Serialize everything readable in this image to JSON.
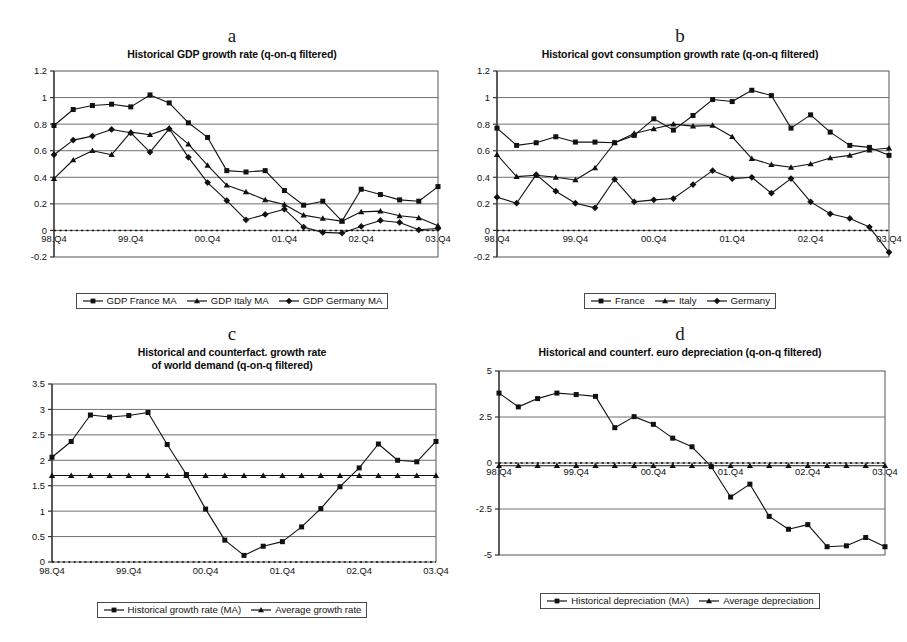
{
  "figure": {
    "panels": [
      "a",
      "b",
      "c",
      "d"
    ]
  },
  "panel_a": {
    "letter": "a",
    "title": "Historical GDP growth rate (q-on-q filtered)",
    "legend": [
      {
        "label": "GDP France MA",
        "marker": "square"
      },
      {
        "label": "GDP Italy MA",
        "marker": "triangle"
      },
      {
        "label": "GDP Germany MA",
        "marker": "diamond"
      }
    ]
  },
  "panel_b": {
    "letter": "b",
    "title": "Historical govt consumption growth rate (q-on-q filtered)",
    "legend": [
      {
        "label": "France",
        "marker": "square"
      },
      {
        "label": "Italy",
        "marker": "triangle"
      },
      {
        "label": "Germany",
        "marker": "diamond"
      }
    ]
  },
  "panel_c": {
    "letter": "c",
    "title_line1": "Historical and counterfact. growth rate",
    "title_line2": "of world demand (q-on-q filtered)",
    "legend": [
      {
        "label": "Historical growth rate (MA)",
        "marker": "square"
      },
      {
        "label": "Average growth rate",
        "marker": "triangle"
      }
    ]
  },
  "panel_d": {
    "letter": "d",
    "title": "Historical and counterf. euro depreciation (q-on-q filtered)",
    "legend": [
      {
        "label": "Historical depreciation (MA)",
        "marker": "square"
      },
      {
        "label": "Average depreciation",
        "marker": "triangle"
      }
    ]
  },
  "chart_data": [
    {
      "id": "a",
      "type": "line",
      "title": "Historical GDP growth rate (q-on-q filtered)",
      "xlabel": "",
      "ylabel": "",
      "ylim": [
        -0.2,
        1.2
      ],
      "yticks": [
        -0.2,
        0,
        0.2,
        0.4,
        0.6,
        0.8,
        1,
        1.2
      ],
      "ytick_labels": [
        "-0.2",
        "0",
        "0.2",
        "0.4",
        "0.6",
        "0.8",
        "1",
        "1.2"
      ],
      "grid": true,
      "zero_line": true,
      "legend_position": "below",
      "x": [
        "98.Q4",
        "99.Q1",
        "99.Q2",
        "99.Q3",
        "99.Q4",
        "00.Q1",
        "00.Q2",
        "00.Q3",
        "00.Q4",
        "01.Q1",
        "01.Q2",
        "01.Q3",
        "01.Q4",
        "02.Q1",
        "02.Q2",
        "02.Q3",
        "02.Q4",
        "03.Q1",
        "03.Q2",
        "03.Q3",
        "03.Q4"
      ],
      "xtick_labels": [
        "98.Q4",
        "99.Q4",
        "00.Q4",
        "01.Q4",
        "02.Q4",
        "03.Q4"
      ],
      "series": [
        {
          "name": "GDP France MA",
          "marker": "square",
          "values": [
            0.79,
            0.91,
            0.94,
            0.95,
            0.93,
            1.02,
            0.96,
            0.81,
            0.7,
            0.45,
            0.44,
            0.45,
            0.3,
            0.19,
            0.22,
            0.07,
            0.31,
            0.27,
            0.23,
            0.22,
            0.33
          ]
        },
        {
          "name": "GDP Italy MA",
          "marker": "triangle",
          "values": [
            0.39,
            0.53,
            0.6,
            0.57,
            0.74,
            0.72,
            0.77,
            0.65,
            0.49,
            0.34,
            0.29,
            0.23,
            0.195,
            0.115,
            0.09,
            0.07,
            0.14,
            0.145,
            0.11,
            0.095,
            0.035
          ]
        },
        {
          "name": "GDP Germany MA",
          "marker": "diamond",
          "values": [
            0.57,
            0.68,
            0.71,
            0.76,
            0.735,
            0.59,
            0.765,
            0.55,
            0.36,
            0.225,
            0.08,
            0.12,
            0.16,
            0.025,
            -0.015,
            -0.02,
            0.03,
            0.075,
            0.06,
            0.005,
            0.015
          ]
        }
      ]
    },
    {
      "id": "b",
      "type": "line",
      "title": "Historical govt consumption growth rate (q-on-q filtered)",
      "xlabel": "",
      "ylabel": "",
      "ylim": [
        -0.2,
        1.2
      ],
      "yticks": [
        -0.2,
        0,
        0.2,
        0.4,
        0.6,
        0.8,
        1,
        1.2
      ],
      "ytick_labels": [
        "-0.2",
        "0",
        "0.2",
        "0.4",
        "0.6",
        "0.8",
        "1",
        "1.2"
      ],
      "grid": true,
      "zero_line": true,
      "legend_position": "below",
      "x": [
        "98.Q4",
        "99.Q1",
        "99.Q2",
        "99.Q3",
        "99.Q4",
        "00.Q1",
        "00.Q2",
        "00.Q3",
        "00.Q4",
        "01.Q1",
        "01.Q2",
        "01.Q3",
        "01.Q4",
        "02.Q1",
        "02.Q2",
        "02.Q3",
        "02.Q4",
        "03.Q1",
        "03.Q2",
        "03.Q3",
        "03.Q4"
      ],
      "xtick_labels": [
        "98.Q4",
        "99.Q4",
        "00.Q4",
        "01.Q4",
        "02.Q4",
        "03.Q4"
      ],
      "series": [
        {
          "name": "France",
          "marker": "square",
          "values": [
            0.77,
            0.64,
            0.66,
            0.705,
            0.665,
            0.665,
            0.66,
            0.715,
            0.84,
            0.755,
            0.865,
            0.985,
            0.97,
            1.055,
            1.015,
            0.77,
            0.87,
            0.74,
            0.64,
            0.625,
            0.565
          ]
        },
        {
          "name": "Italy",
          "marker": "triangle",
          "values": [
            0.57,
            0.405,
            0.415,
            0.4,
            0.38,
            0.47,
            0.66,
            0.73,
            0.765,
            0.8,
            0.785,
            0.79,
            0.705,
            0.54,
            0.495,
            0.475,
            0.5,
            0.545,
            0.565,
            0.605,
            0.62
          ]
        },
        {
          "name": "Germany",
          "marker": "diamond",
          "values": [
            0.25,
            0.205,
            0.42,
            0.295,
            0.205,
            0.17,
            0.385,
            0.215,
            0.23,
            0.24,
            0.345,
            0.45,
            0.39,
            0.4,
            0.28,
            0.39,
            0.215,
            0.125,
            0.09,
            0.025,
            -0.165
          ]
        }
      ]
    },
    {
      "id": "c",
      "type": "line",
      "title": "Historical and counterfact. growth rate of world demand (q-on-q filtered)",
      "xlabel": "",
      "ylabel": "",
      "ylim": [
        0,
        3.5
      ],
      "yticks": [
        0,
        0.5,
        1,
        1.5,
        2,
        2.5,
        3,
        3.5
      ],
      "ytick_labels": [
        "0",
        "0.5",
        "1",
        "1.5",
        "2",
        "2.5",
        "3",
        "3.5"
      ],
      "grid": true,
      "zero_line": true,
      "legend_position": "below",
      "x": [
        "98.Q4",
        "99.Q1",
        "99.Q2",
        "99.Q3",
        "99.Q4",
        "00.Q1",
        "00.Q2",
        "00.Q3",
        "00.Q4",
        "01.Q1",
        "01.Q2",
        "01.Q3",
        "01.Q4",
        "02.Q1",
        "02.Q2",
        "02.Q3",
        "02.Q4",
        "03.Q1",
        "03.Q2",
        "03.Q3",
        "03.Q4"
      ],
      "xtick_labels": [
        "98.Q4",
        "99.Q4",
        "00.Q4",
        "01.Q4",
        "02.Q4",
        "03.Q4"
      ],
      "series": [
        {
          "name": "Historical growth rate (MA)",
          "marker": "square",
          "values": [
            2.06,
            2.37,
            2.89,
            2.85,
            2.88,
            2.94,
            2.31,
            1.72,
            1.04,
            0.43,
            0.13,
            0.31,
            0.4,
            0.69,
            1.05,
            1.48,
            1.85,
            2.32,
            2.0,
            1.97,
            2.37
          ]
        },
        {
          "name": "Average growth rate",
          "marker": "triangle",
          "values": [
            1.7,
            1.7,
            1.7,
            1.7,
            1.7,
            1.7,
            1.7,
            1.7,
            1.7,
            1.7,
            1.7,
            1.7,
            1.7,
            1.7,
            1.7,
            1.7,
            1.7,
            1.7,
            1.7,
            1.7,
            1.7
          ]
        }
      ]
    },
    {
      "id": "d",
      "type": "line",
      "title": "Historical and counterf. euro depreciation (q-on-q filtered)",
      "xlabel": "",
      "ylabel": "",
      "ylim": [
        -5,
        5
      ],
      "yticks": [
        -5,
        -2.5,
        0,
        2.5,
        5
      ],
      "ytick_labels": [
        "-5",
        "-2.5",
        "0",
        "2.5",
        "5"
      ],
      "grid": true,
      "zero_line": true,
      "legend_position": "below",
      "x": [
        "98.Q4",
        "99.Q1",
        "99.Q2",
        "99.Q3",
        "99.Q4",
        "00.Q1",
        "00.Q2",
        "00.Q3",
        "00.Q4",
        "01.Q1",
        "01.Q2",
        "01.Q3",
        "01.Q4",
        "02.Q1",
        "02.Q2",
        "02.Q3",
        "02.Q4",
        "03.Q1",
        "03.Q2",
        "03.Q3",
        "03.Q4"
      ],
      "xtick_labels": [
        "98.Q4",
        "99.Q4",
        "00.Q4",
        "01.Q4",
        "02.Q4",
        "03.Q4"
      ],
      "series": [
        {
          "name": "Historical depreciation (MA)",
          "marker": "square",
          "values": [
            3.8,
            3.05,
            3.5,
            3.8,
            3.72,
            3.62,
            1.92,
            2.52,
            2.1,
            1.35,
            0.88,
            -0.2,
            -1.85,
            -1.15,
            -2.9,
            -3.6,
            -3.35,
            -4.55,
            -4.5,
            -4.05,
            -4.55
          ]
        },
        {
          "name": "Average depreciation",
          "marker": "triangle",
          "values": [
            -0.15,
            -0.15,
            -0.15,
            -0.15,
            -0.15,
            -0.15,
            -0.15,
            -0.15,
            -0.15,
            -0.15,
            -0.15,
            -0.15,
            -0.15,
            -0.15,
            -0.15,
            -0.15,
            -0.15,
            -0.15,
            -0.15,
            -0.15,
            -0.15
          ]
        }
      ]
    }
  ]
}
